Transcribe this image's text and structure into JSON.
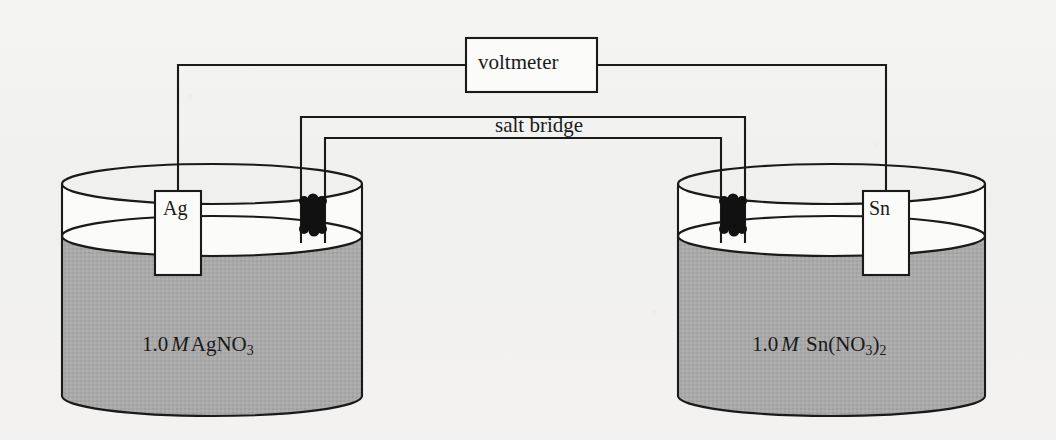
{
  "diagram": {
    "meter": {
      "label": "voltmeter"
    },
    "salt_bridge": {
      "label": "salt bridge"
    },
    "left_cell": {
      "electrode_label": "Ag",
      "solution_concentration": "1.0",
      "solution_molarity_symbol": "M",
      "solution_formula_main": "AgNO",
      "solution_formula_sub1": "3",
      "solution_formula_tail": "",
      "solution_formula_sub2": ""
    },
    "right_cell": {
      "electrode_label": "Sn",
      "solution_concentration": "1.0",
      "solution_molarity_symbol": "M",
      "solution_formula_main": "Sn(NO",
      "solution_formula_sub1": "3",
      "solution_formula_tail": ")",
      "solution_formula_sub2": "2"
    },
    "colors": {
      "ink": "#1a1a1a",
      "solution_fill": "#a9a9a9",
      "beaker_air": "#fbfbfa",
      "plug_fill": "#111111",
      "background": "#f2f2f1"
    }
  }
}
